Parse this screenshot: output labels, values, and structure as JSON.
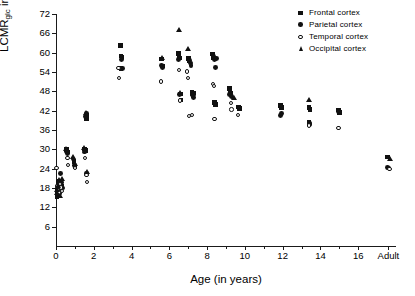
{
  "chart_data": {
    "type": "scatter",
    "title": "",
    "xlabel": "Age (in years)",
    "ylabel": "LCMRglc in µmol/min/100g",
    "ylabel_main": "LCMR",
    "ylabel_sub": "glc",
    "ylabel_rest": " in µmol/min/100g",
    "xlim": [
      0,
      18
    ],
    "ylim": [
      0,
      72
    ],
    "grid": false,
    "legend_position": "top-right",
    "yticks": [
      6,
      12,
      18,
      24,
      30,
      36,
      42,
      48,
      54,
      60,
      66,
      72
    ],
    "xticks": [
      0,
      2,
      4,
      6,
      8,
      10,
      12,
      14,
      16
    ],
    "xtick_labels": [
      "0",
      "2",
      "4",
      "6",
      "8",
      "10",
      "12",
      "14",
      "16"
    ],
    "x_extra_tick": {
      "value": 17.6,
      "label": "Adult"
    },
    "x_minor_ticks": [
      1,
      3,
      5,
      7,
      9,
      11,
      13,
      15
    ],
    "series": [
      {
        "name": "Frontal cortex",
        "marker": "filled-square",
        "color": "#111111",
        "points": [
          [
            0.05,
            15.4
          ],
          [
            0.06,
            16.2
          ],
          [
            0.08,
            17.2
          ],
          [
            0.1,
            18.1
          ],
          [
            0.12,
            19.0
          ],
          [
            0.14,
            16.8
          ],
          [
            0.16,
            15.8
          ],
          [
            0.2,
            20.0
          ],
          [
            0.25,
            17.6
          ],
          [
            0.3,
            18.6
          ],
          [
            0.55,
            29.9
          ],
          [
            0.6,
            29.2
          ],
          [
            0.95,
            26.3
          ],
          [
            1.0,
            24.5
          ],
          [
            1.5,
            30.1
          ],
          [
            1.55,
            29.6
          ],
          [
            1.6,
            40.6
          ],
          [
            1.62,
            39.4
          ],
          [
            3.4,
            62.3
          ],
          [
            3.45,
            59.0
          ],
          [
            3.5,
            58.6
          ],
          [
            3.45,
            55.1
          ],
          [
            5.6,
            58.0
          ],
          [
            5.65,
            55.9
          ],
          [
            6.5,
            59.8
          ],
          [
            6.55,
            58.4
          ],
          [
            6.6,
            47.2
          ],
          [
            6.62,
            45.3
          ],
          [
            7.0,
            58.2
          ],
          [
            7.05,
            57.4
          ],
          [
            7.2,
            47.8
          ],
          [
            7.25,
            46.6
          ],
          [
            7.3,
            47.5
          ],
          [
            8.3,
            59.6
          ],
          [
            8.35,
            58.3
          ],
          [
            8.4,
            44.6
          ],
          [
            8.45,
            43.9
          ],
          [
            9.2,
            48.9
          ],
          [
            9.25,
            47.3
          ],
          [
            9.65,
            43.2
          ],
          [
            9.7,
            42.6
          ],
          [
            11.9,
            43.6
          ],
          [
            11.95,
            43.0
          ],
          [
            13.4,
            43.0
          ],
          [
            13.45,
            42.4
          ],
          [
            13.4,
            38.4
          ],
          [
            14.95,
            42.2
          ],
          [
            15.0,
            41.4
          ],
          [
            17.55,
            27.6
          ]
        ]
      },
      {
        "name": "Parietal cortex",
        "marker": "filled-circle",
        "color": "#111111",
        "points": [
          [
            0.05,
            16.0
          ],
          [
            0.07,
            17.0
          ],
          [
            0.09,
            18.4
          ],
          [
            0.11,
            19.5
          ],
          [
            0.13,
            20.2
          ],
          [
            0.15,
            17.8
          ],
          [
            0.18,
            16.4
          ],
          [
            0.22,
            22.6
          ],
          [
            0.28,
            19.8
          ],
          [
            0.35,
            18.0
          ],
          [
            0.55,
            29.4
          ],
          [
            0.6,
            28.6
          ],
          [
            0.9,
            27.0
          ],
          [
            1.0,
            25.0
          ],
          [
            1.5,
            29.2
          ],
          [
            1.58,
            40.2
          ],
          [
            1.6,
            41.2
          ],
          [
            1.62,
            22.4
          ],
          [
            3.45,
            58.0
          ],
          [
            3.5,
            55.0
          ],
          [
            5.6,
            56.0
          ],
          [
            5.65,
            55.3
          ],
          [
            6.5,
            58.0
          ],
          [
            6.55,
            47.0
          ],
          [
            7.05,
            57.6
          ],
          [
            7.1,
            56.8
          ],
          [
            7.15,
            56.0
          ],
          [
            7.2,
            47.0
          ],
          [
            7.28,
            46.2
          ],
          [
            8.35,
            58.9
          ],
          [
            8.4,
            57.8
          ],
          [
            8.45,
            55.4
          ],
          [
            8.5,
            58.2
          ],
          [
            9.2,
            47.0
          ],
          [
            9.3,
            46.4
          ],
          [
            9.7,
            42.8
          ],
          [
            11.9,
            40.4
          ],
          [
            11.95,
            41.0
          ],
          [
            13.4,
            37.6
          ],
          [
            13.45,
            38.0
          ],
          [
            14.95,
            41.8
          ],
          [
            17.55,
            24.4
          ],
          [
            17.6,
            24.2
          ]
        ]
      },
      {
        "name": "Temporal cortex",
        "marker": "open-circle",
        "color": "#111111",
        "points": [
          [
            0.03,
            24.2
          ],
          [
            0.06,
            18.6
          ],
          [
            0.1,
            17.4
          ],
          [
            0.14,
            16.6
          ],
          [
            0.2,
            19.2
          ],
          [
            0.26,
            18.2
          ],
          [
            0.33,
            17.0
          ],
          [
            0.6,
            27.4
          ],
          [
            0.62,
            25.2
          ],
          [
            1.0,
            24.2
          ],
          [
            1.55,
            27.4
          ],
          [
            1.62,
            22.0
          ],
          [
            1.64,
            19.8
          ],
          [
            3.3,
            55.2
          ],
          [
            3.35,
            52.1
          ],
          [
            5.55,
            51.0
          ],
          [
            6.5,
            54.7
          ],
          [
            6.55,
            45.2
          ],
          [
            6.95,
            54.2
          ],
          [
            7.0,
            52.2
          ],
          [
            7.05,
            40.4
          ],
          [
            7.2,
            40.6
          ],
          [
            8.3,
            50.2
          ],
          [
            8.35,
            49.6
          ],
          [
            8.4,
            39.4
          ],
          [
            9.25,
            44.4
          ],
          [
            9.3,
            42.4
          ],
          [
            9.65,
            40.6
          ],
          [
            13.4,
            37.4
          ],
          [
            14.95,
            36.6
          ],
          [
            17.65,
            23.9
          ]
        ]
      },
      {
        "name": "Occipital cortex",
        "marker": "filled-triangle",
        "color": "#111111",
        "points": [
          [
            0.05,
            16.6
          ],
          [
            0.08,
            17.6
          ],
          [
            0.12,
            18.8
          ],
          [
            0.16,
            20.6
          ],
          [
            0.2,
            15.6
          ],
          [
            0.3,
            21.0
          ],
          [
            0.55,
            30.2
          ],
          [
            0.9,
            27.6
          ],
          [
            1.0,
            25.4
          ],
          [
            1.5,
            30.4
          ],
          [
            1.6,
            41.4
          ],
          [
            1.62,
            23.0
          ],
          [
            5.6,
            58.4
          ],
          [
            6.5,
            67.2
          ],
          [
            6.55,
            47.6
          ],
          [
            7.0,
            61.2
          ],
          [
            7.25,
            47.2
          ],
          [
            9.45,
            46.0
          ],
          [
            13.4,
            45.4
          ],
          [
            17.7,
            27.2
          ]
        ]
      }
    ]
  },
  "legend": {
    "items": [
      {
        "label": "Frontal cortex",
        "marker": "filled-square"
      },
      {
        "label": "Parietal cortex",
        "marker": "filled-circle"
      },
      {
        "label": "Temporal cortex",
        "marker": "open-circle"
      },
      {
        "label": "Occipital cortex",
        "marker": "filled-triangle"
      }
    ]
  }
}
